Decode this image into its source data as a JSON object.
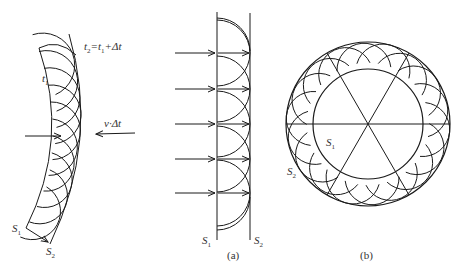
{
  "figure_left": {
    "labels": {
      "t1": "t",
      "t1_sub": "1",
      "t2_eq": "t",
      "t2_sub": "2",
      "t2_rest": "=t",
      "t2_rest_sub": "1",
      "t2_tail": "+Δt",
      "velocity": "v·Δt",
      "s1": "S",
      "s1_sub": "1",
      "s2": "S",
      "s2_sub": "2"
    }
  },
  "figure_a": {
    "caption": "(a)",
    "labels": {
      "s1": "S",
      "s1_sub": "1",
      "s2": "S",
      "s2_sub": "2"
    },
    "arrow_y": [
      53,
      89,
      124,
      159,
      193
    ]
  },
  "figure_b": {
    "caption": "(b)",
    "labels": {
      "s1": "S",
      "s1_sub": "1",
      "s2": "S",
      "s2_sub": "2"
    },
    "center": [
      368,
      124
    ],
    "outer_radius": 82,
    "inner_radius": 55,
    "wavelet_count": 18
  },
  "footer": {
    "text": ""
  },
  "colors": {
    "stroke": "#1a1a1a",
    "label": "#333333",
    "background": "#ffffff"
  }
}
